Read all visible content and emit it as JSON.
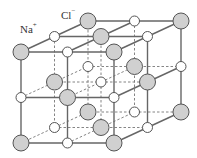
{
  "labels": {
    "sodium": {
      "text": "Na",
      "charge": "+",
      "x": 20,
      "y": 23
    },
    "chloride": {
      "text": "Cl",
      "charge": "−",
      "x": 61,
      "y": 9
    }
  },
  "lattice": {
    "size": 3,
    "origin": [
      21,
      52
    ],
    "step_x": 46.5,
    "step_y": 45.5,
    "depth_dx": 33.5,
    "depth_dy": -15.5,
    "cl_radius": 8,
    "na_radius": 5
  },
  "colors": {
    "chloride_fill": "#d0d0d0",
    "chloride_stroke": "#555555",
    "sodium_fill": "#ffffff",
    "sodium_stroke": "#555555",
    "solid_line": "#666666",
    "dashed_line": "#777777"
  },
  "legend": [
    {
      "ion": "Na+",
      "appearance": "small white circle"
    },
    {
      "ion": "Cl-",
      "appearance": "large grey circle"
    }
  ]
}
